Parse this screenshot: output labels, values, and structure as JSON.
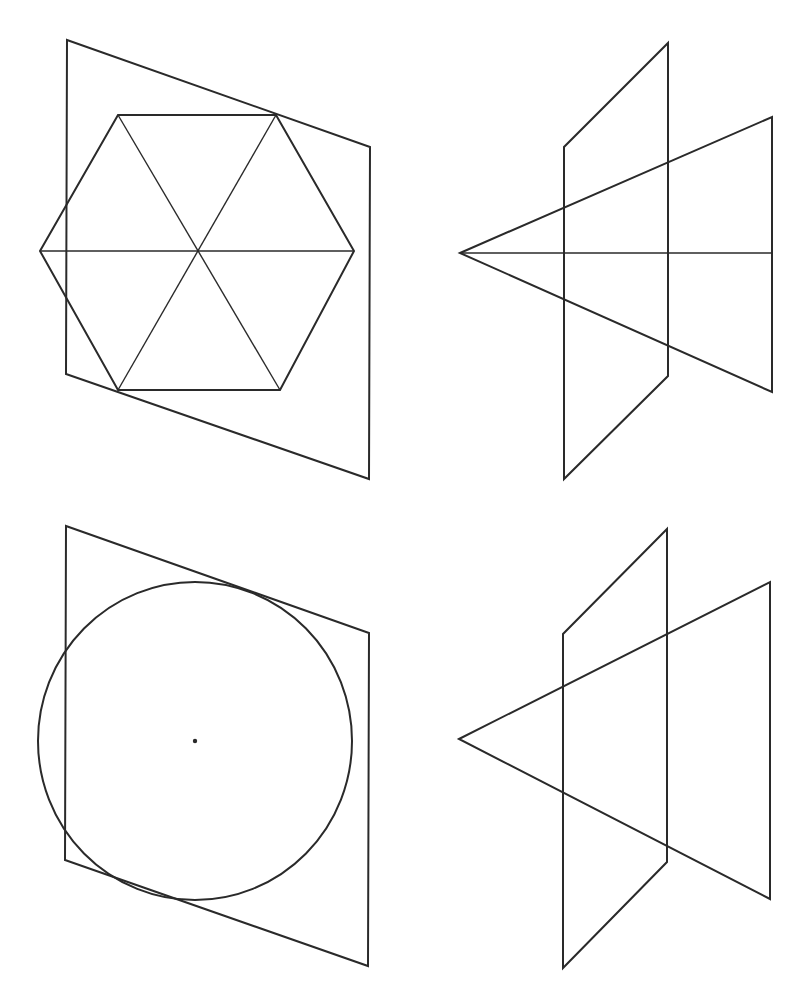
{
  "figure": {
    "width": 802,
    "height": 994,
    "stroke_color": "#2a2a2a",
    "background": "#ffffff",
    "panels": [
      {
        "id": "hexagon-front-view",
        "plane": [
          [
            67,
            40
          ],
          [
            370,
            147
          ],
          [
            369,
            479
          ],
          [
            66,
            374
          ]
        ],
        "hexagon": [
          [
            118,
            115
          ],
          [
            276,
            115
          ],
          [
            354,
            251
          ],
          [
            280,
            390
          ],
          [
            118,
            390
          ],
          [
            40,
            251
          ]
        ],
        "center": [
          198,
          251
        ]
      },
      {
        "id": "hexagon-side-view",
        "plane": [
          [
            668,
            43
          ],
          [
            668,
            376
          ],
          [
            564,
            479
          ],
          [
            564,
            147
          ]
        ],
        "triangle": [
          [
            460,
            253
          ],
          [
            772,
            117
          ],
          [
            772,
            392
          ]
        ],
        "axis": [
          [
            460,
            253
          ],
          [
            772,
            253
          ]
        ]
      },
      {
        "id": "circle-front-view",
        "plane": [
          [
            66,
            526
          ],
          [
            369,
            633
          ],
          [
            368,
            966
          ],
          [
            65,
            860
          ]
        ],
        "circle": {
          "cx": 195,
          "cy": 741,
          "rx": 157,
          "ry": 159
        },
        "center_dot": [
          195,
          741
        ]
      },
      {
        "id": "circle-side-view",
        "plane": [
          [
            667,
            529
          ],
          [
            667,
            862
          ],
          [
            563,
            968
          ],
          [
            563,
            634
          ]
        ],
        "triangle": [
          [
            459,
            739
          ],
          [
            770,
            582
          ],
          [
            770,
            899
          ]
        ]
      }
    ]
  }
}
